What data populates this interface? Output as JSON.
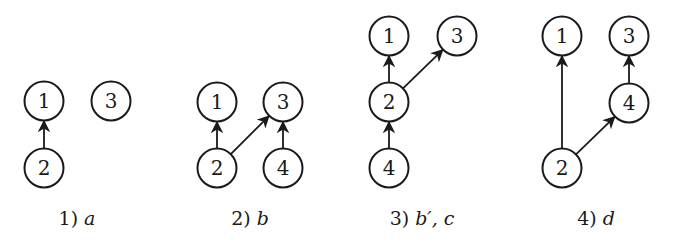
{
  "style": {
    "stroke_color": "#1a1a1a",
    "background": "#ffffff",
    "node_radius": 19.5
  },
  "diagrams": [
    {
      "caption": {
        "number": "1)",
        "symbol": "a",
        "x": 77,
        "y": 225
      },
      "nodes": [
        {
          "id": "1",
          "label": "1",
          "x": 44,
          "y": 101
        },
        {
          "id": "3",
          "label": "3",
          "x": 111,
          "y": 101
        },
        {
          "id": "2",
          "label": "2",
          "x": 44,
          "y": 168
        }
      ],
      "edges": [
        {
          "from": "2",
          "to": "1"
        }
      ]
    },
    {
      "caption": {
        "number": "2)",
        "symbol": "b",
        "x": 250,
        "y": 225
      },
      "nodes": [
        {
          "id": "1",
          "label": "1",
          "x": 217,
          "y": 102
        },
        {
          "id": "3",
          "label": "3",
          "x": 283,
          "y": 102
        },
        {
          "id": "2",
          "label": "2",
          "x": 217,
          "y": 168
        },
        {
          "id": "4",
          "label": "4",
          "x": 283,
          "y": 168
        }
      ],
      "edges": [
        {
          "from": "2",
          "to": "1"
        },
        {
          "from": "2",
          "to": "3"
        },
        {
          "from": "4",
          "to": "3"
        }
      ]
    },
    {
      "caption": {
        "number": "3)",
        "symbol": "b′, c",
        "x": 422,
        "y": 225
      },
      "nodes": [
        {
          "id": "1",
          "label": "1",
          "x": 389,
          "y": 36
        },
        {
          "id": "3",
          "label": "3",
          "x": 457,
          "y": 36
        },
        {
          "id": "2",
          "label": "2",
          "x": 389,
          "y": 102
        },
        {
          "id": "4",
          "label": "4",
          "x": 389,
          "y": 168
        }
      ],
      "edges": [
        {
          "from": "2",
          "to": "1"
        },
        {
          "from": "2",
          "to": "3"
        },
        {
          "from": "4",
          "to": "2"
        }
      ]
    },
    {
      "caption": {
        "number": "4)",
        "symbol": "d",
        "x": 596,
        "y": 225
      },
      "nodes": [
        {
          "id": "1",
          "label": "1",
          "x": 562,
          "y": 36
        },
        {
          "id": "3",
          "label": "3",
          "x": 629,
          "y": 36
        },
        {
          "id": "4",
          "label": "4",
          "x": 629,
          "y": 103
        },
        {
          "id": "2",
          "label": "2",
          "x": 562,
          "y": 168
        }
      ],
      "edges": [
        {
          "from": "2",
          "to": "1"
        },
        {
          "from": "2",
          "to": "4"
        },
        {
          "from": "4",
          "to": "3"
        }
      ]
    }
  ]
}
